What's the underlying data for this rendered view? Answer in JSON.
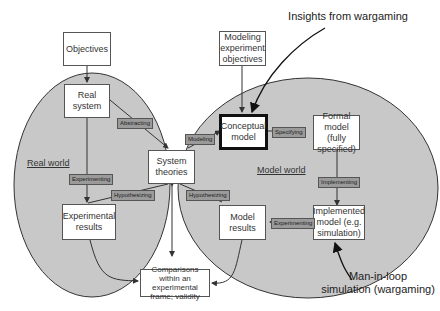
{
  "diagram": {
    "annotations": {
      "insights": "Insights from wargaming",
      "man_in_loop": "Man-in-loop\nsimulation (wargaming)"
    },
    "regions": {
      "real_world": "Real world",
      "model_world": "Model world"
    },
    "boxes": {
      "objectives": "Objectives",
      "real_system": "Real system",
      "system_theories": "System theories",
      "experimental_results": "Experimental results",
      "modeling_objectives": "Modeling experiment objectives",
      "conceptual_model": "Conceptual model",
      "formal_model": "Formal model (fully specified)",
      "implemented_model": "Implemented model (e.g. simulation)",
      "model_results": "Model results",
      "comparisons": "Comparisons within an experimental frame; validity"
    },
    "edge_labels": {
      "abstracting": "Abstracting",
      "modeling": "Modeling",
      "experimenting_real": "Experimenting",
      "hypothesizing_left": "Hypothesizing",
      "hypothesizing_right": "Hypothesizing",
      "specifying": "Specifying",
      "implementing": "Implementing",
      "experimenting_model": "Experimenting"
    },
    "colors": {
      "region_fill": "#c8c8c8",
      "tag_fill": "#9a9a9a",
      "line": "#333333"
    }
  }
}
